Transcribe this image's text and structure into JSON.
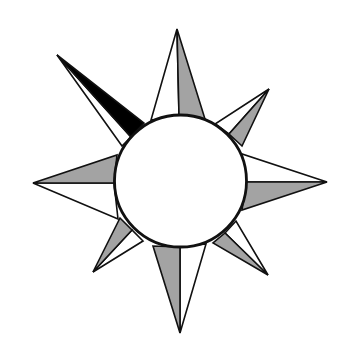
{
  "diagram": {
    "type": "compass-rose",
    "points": 8,
    "highlighted_point": "northwest",
    "colors": {
      "background": "#ffffff",
      "stroke": "#111111",
      "shade": "#a3a3a3",
      "highlight": "#000000",
      "center_fill": "#ffffff"
    },
    "center": {
      "cx": 180.5,
      "cy": 181,
      "r": 66
    }
  }
}
